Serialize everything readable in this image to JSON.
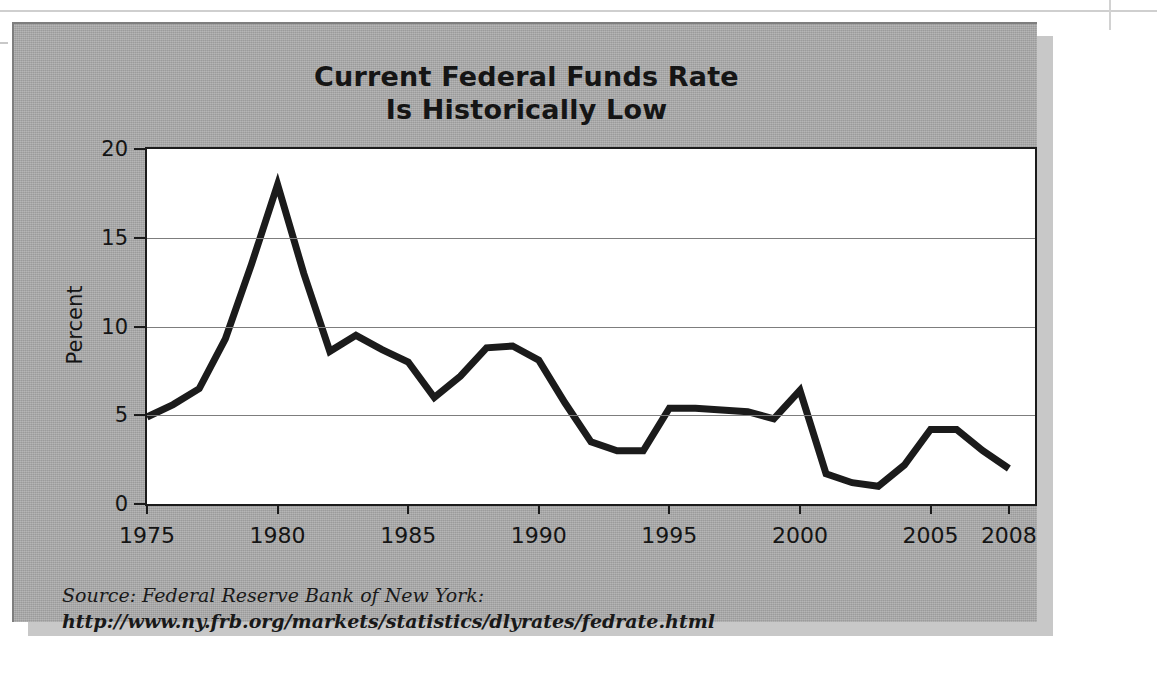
{
  "figure": {
    "title_line1": "Current Federal Funds Rate",
    "title_line2": "Is Historically Low",
    "background_color": "#a8a8a8",
    "plot_background_color": "#ffffff",
    "line_color": "#1b1b1b",
    "source_line1": "Source: Federal Reserve Bank of New York:",
    "source_line2": "http://www.ny.frb.org/markets/statistics/dlyrates/fedrate.html"
  },
  "chart_data": {
    "type": "line",
    "title": "Current Federal Funds Rate Is Historically Low",
    "xlabel": "",
    "ylabel": "Percent",
    "xlim": [
      1975,
      2009
    ],
    "ylim": [
      0,
      20
    ],
    "ytick_labels": [
      "0",
      "5",
      "10",
      "15",
      "20"
    ],
    "ytick_values": [
      0,
      5,
      10,
      15,
      20
    ],
    "xtick_labels": [
      "1975",
      "1980",
      "1985",
      "1990",
      "1995",
      "2000",
      "2005",
      "2008"
    ],
    "xtick_values": [
      1975,
      1980,
      1985,
      1990,
      1995,
      2000,
      2005,
      2008
    ],
    "grid": "horizontal",
    "legend": "none",
    "series": [
      {
        "name": "Federal Funds Rate",
        "x": [
          1975,
          1976,
          1977,
          1978,
          1979,
          1980,
          1981,
          1982,
          1983,
          1984,
          1985,
          1986,
          1987,
          1988,
          1989,
          1990,
          1991,
          1992,
          1993,
          1994,
          1995,
          1996,
          1997,
          1998,
          1999,
          2000,
          2001,
          2002,
          2003,
          2004,
          2005,
          2006,
          2007,
          2008
        ],
        "values": [
          4.9,
          5.6,
          6.5,
          9.3,
          13.5,
          18.0,
          13.0,
          8.6,
          9.5,
          8.7,
          8.0,
          6.0,
          7.2,
          8.8,
          8.9,
          8.1,
          5.7,
          3.5,
          3.0,
          3.0,
          5.4,
          5.4,
          5.3,
          5.2,
          4.8,
          6.4,
          1.7,
          1.2,
          1.0,
          2.2,
          4.2,
          4.2,
          3.0,
          2.0
        ]
      }
    ]
  }
}
